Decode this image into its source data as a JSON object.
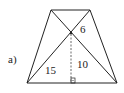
{
  "figure": {
    "part_label": "a)",
    "labels": {
      "upper_segment": "6",
      "height": "10",
      "lower_segment": "15"
    },
    "shape": "trapezoid",
    "vertices": {
      "top_left": [
        51,
        10
      ],
      "top_right": [
        90,
        10
      ],
      "bottom_left": [
        27,
        83
      ],
      "bottom_right": [
        117,
        83
      ]
    },
    "intersection": [
      71,
      33
    ],
    "colors": {
      "stroke": "#222222",
      "background": "#ffffff"
    }
  }
}
